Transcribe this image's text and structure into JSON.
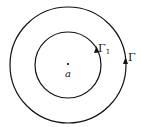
{
  "diagram": {
    "center_label": "a",
    "inner_contour_label": "Γ",
    "inner_contour_subscript": "1",
    "outer_contour_label": "Γ",
    "stroke_color": "#111111",
    "background": "#ffffff"
  }
}
